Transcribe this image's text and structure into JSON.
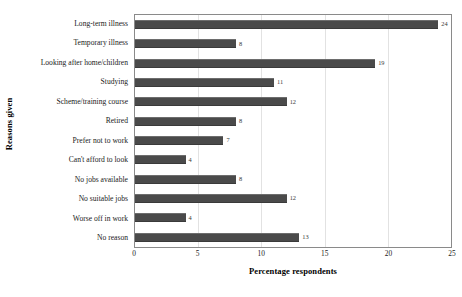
{
  "chart_data": {
    "type": "bar",
    "orientation": "horizontal",
    "title": "",
    "xlabel": "Percentage respondents",
    "ylabel": "Reasons given",
    "xlim": [
      0,
      25
    ],
    "xticks": [
      "0",
      "5",
      "10",
      "15",
      "20",
      "25"
    ],
    "grid": true,
    "legend": false,
    "bar_color": "#4a4a4a",
    "categories": [
      "Long-term illness",
      "Temporary illness",
      "Looking after home/children",
      "Studying",
      "Scheme/training course",
      "Retired",
      "Prefer not to work",
      "Can't afford to look",
      "No jobs available",
      "No suitable jobs",
      "Worse off in work",
      "No reason"
    ],
    "values": [
      24,
      8,
      19,
      11,
      12,
      8,
      7,
      4,
      8,
      12,
      4,
      13
    ],
    "data_labels": [
      "24",
      "8",
      "19",
      "11",
      "12",
      "8",
      "7",
      "4",
      "8",
      "12",
      "4",
      "13"
    ]
  }
}
